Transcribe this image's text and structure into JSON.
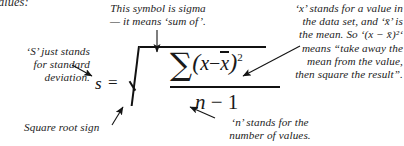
{
  "figure": {
    "kind": "annotated-formula",
    "background_color": "#ffffff",
    "ink_color": "#1a1a1a"
  },
  "cutoff_fragment": {
    "text": "alues:"
  },
  "formula": {
    "lhs": "s",
    "equals": "=",
    "radical_sign": "√",
    "numerator": {
      "sigma": "∑",
      "open_paren": "(",
      "x": "x",
      "minus": "−",
      "x_bar": "x",
      "close_paren": ")",
      "exponent": "2"
    },
    "denominator": {
      "n": "n",
      "minus": "−",
      "one": "1"
    },
    "plain_text": "s = √( ∑(x − x̄)² / (n − 1) )"
  },
  "annotations": [
    {
      "id": "sigma-note",
      "position": "top-center",
      "lines": [
        "This symbol is sigma",
        "— it means ‘sum of’."
      ],
      "arrow": "down-to-sigma"
    },
    {
      "id": "s-note",
      "position": "left",
      "lines": [
        "‘S’ just stands",
        "for standard",
        "deviation."
      ],
      "arrow": "down-right-to-s"
    },
    {
      "id": "x-note",
      "position": "right",
      "lines": [
        "‘x’ stands for a value in",
        "the data set, and ‘x̄’ is",
        "the mean.  So ‘(x − x̄)²‘",
        "means “take away the",
        "mean from the value,",
        "then square the result”."
      ],
      "arrow": "down-left-to-squared-term"
    },
    {
      "id": "sqrt-note",
      "position": "bottom-left",
      "lines": [
        "Square root sign"
      ],
      "arrow": "up-right-to-radical"
    },
    {
      "id": "n-note",
      "position": "bottom-right",
      "lines": [
        "‘n’ stands for the",
        "number of values."
      ],
      "arrow": "up-left-to-n"
    }
  ]
}
